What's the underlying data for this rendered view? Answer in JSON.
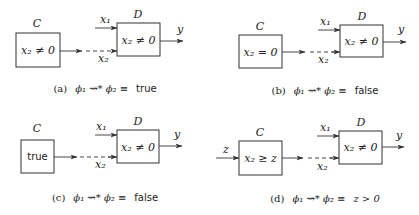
{
  "panels": [
    {
      "id": "a",
      "component_c": {
        "label": "C",
        "condition": "x₂ ≠ 0",
        "condition_style": "math"
      },
      "component_d": {
        "label": "D",
        "condition": "x₂ ≠ 0"
      },
      "inputs_d": [
        "x₁",
        "x₂"
      ],
      "output": "y",
      "external_input": null,
      "caption": {
        "tag": "(a)",
        "formula": "ϕ₁ ⇝* ϕ₂ ≡",
        "result": "true",
        "result_style": "sans"
      }
    },
    {
      "id": "b",
      "component_c": {
        "label": "C",
        "condition": "x₂ = 0",
        "condition_style": "math"
      },
      "component_d": {
        "label": "D",
        "condition": "x₂ ≠ 0"
      },
      "inputs_d": [
        "x₁",
        "x₂"
      ],
      "output": "y",
      "external_input": null,
      "caption": {
        "tag": "(b)",
        "formula": "ϕ₁ ⇝* ϕ₂ ≡",
        "result": "false",
        "result_style": "sans"
      }
    },
    {
      "id": "c",
      "component_c": {
        "label": "C",
        "condition": "true",
        "condition_style": "sans"
      },
      "component_d": {
        "label": "D",
        "condition": "x₂ ≠ 0"
      },
      "inputs_d": [
        "x₁",
        "x₂"
      ],
      "output": "y",
      "external_input": null,
      "caption": {
        "tag": "(c)",
        "formula": "ϕ₁ ⇝* ϕ₂ ≡",
        "result": "false",
        "result_style": "sans"
      }
    },
    {
      "id": "d",
      "component_c": {
        "label": "C",
        "condition": "x₂ ≥ z",
        "condition_style": "math"
      },
      "component_d": {
        "label": "D",
        "condition": "x₂ ≠ 0"
      },
      "inputs_d": [
        "x₁",
        "x₂"
      ],
      "output": "y",
      "external_input": "z",
      "caption": {
        "tag": "(d)",
        "formula": "ϕ₁ ⇝* ϕ₂ ≡",
        "result": "z > 0",
        "result_style": "math"
      }
    }
  ]
}
